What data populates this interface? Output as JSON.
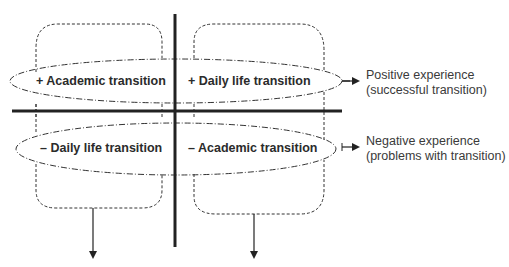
{
  "diagram": {
    "quadrants": {
      "top_left": "+ Academic transition",
      "top_right": "+ Daily life transition",
      "bottom_left": "– Daily life transition",
      "bottom_right": "– Academic transition"
    },
    "outcomes": {
      "positive_line1": "Positive experience",
      "positive_line2": "(successful transition)",
      "negative_line1": "Negative experience",
      "negative_line2": "(problems with transition)"
    },
    "colors": {
      "line": "#2b2b2b",
      "text": "#2b2b2b"
    }
  }
}
